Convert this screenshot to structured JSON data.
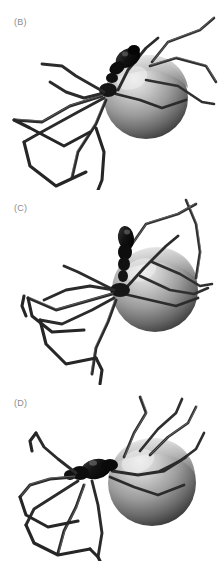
{
  "figure": {
    "background_color": "#ffffff",
    "width": 219,
    "height": 561,
    "label_color": "#8c8c8c"
  },
  "panels": [
    {
      "id": "panel-b",
      "label": "(B)",
      "label_x": 14,
      "label_y": 17,
      "top": 0,
      "height": 190,
      "pose": "oblique-front-left, cephalothorax raised, abdomen right",
      "colors": {
        "abdomen_highlight": "#e6e6e6",
        "abdomen_mid": "#9a9a9a",
        "abdomen_shadow": "#4a4a4a",
        "cephalothorax": "#171717",
        "leg": "#2b2b2b",
        "leg_light": "#6e6e6e"
      }
    },
    {
      "id": "panel-c",
      "label": "(C)",
      "label_x": 14,
      "label_y": 203,
      "top": 190,
      "height": 200,
      "pose": "oblique-front-left, cephalothorax upright, abdomen right",
      "colors": {
        "abdomen_highlight": "#e6e6e6",
        "abdomen_mid": "#9a9a9a",
        "abdomen_shadow": "#4a4a4a",
        "cephalothorax": "#171717",
        "leg": "#2b2b2b",
        "leg_light": "#6e6e6e"
      }
    },
    {
      "id": "panel-d",
      "label": "(D)",
      "label_x": 14,
      "label_y": 398,
      "top": 385,
      "height": 176,
      "pose": "lateral-left, legs splayed forward, abdomen right",
      "colors": {
        "abdomen_highlight": "#e6e6e6",
        "abdomen_mid": "#9a9a9a",
        "abdomen_shadow": "#4a4a4a",
        "cephalothorax": "#171717",
        "leg": "#2b2b2b",
        "leg_light": "#6e6e6e"
      }
    }
  ]
}
